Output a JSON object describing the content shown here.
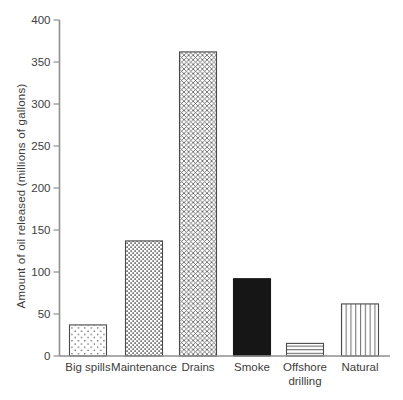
{
  "figure": {
    "kind": "scanned textbook bar chart",
    "title": "",
    "background": "#ffffff"
  },
  "chart_data": {
    "type": "bar",
    "title": "",
    "xlabel": "",
    "ylabel": "Amount of oil released (millions of gallons)",
    "categories": [
      "Big spills",
      "Maintenance",
      "Drains",
      "Smoke",
      "Offshore drilling",
      "Natural"
    ],
    "category_lines": [
      [
        "Big spills"
      ],
      [
        "Maintenance"
      ],
      [
        "Drains"
      ],
      [
        "Smoke"
      ],
      [
        "Offshore",
        "drilling"
      ],
      [
        "Natural"
      ]
    ],
    "values": [
      37,
      137,
      362,
      92,
      15,
      62
    ],
    "ylim": [
      0,
      400
    ],
    "yticks": [
      0,
      50,
      100,
      150,
      200,
      250,
      300,
      350,
      400
    ],
    "grid": false,
    "legend": "none",
    "bar_patterns": [
      "sparse-dots",
      "dense-dots",
      "crosshatch",
      "solid-black",
      "horizontal-lines",
      "vertical-lines"
    ]
  },
  "colors": {
    "ink": "#3d3d3d",
    "axis": "#8f8f8f",
    "tick": "#8f8f8f",
    "bar_outline": "#4a4a4a",
    "solid_fill": "#161616",
    "background": "#ffffff"
  }
}
